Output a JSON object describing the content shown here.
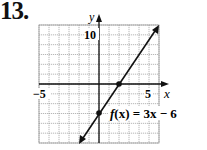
{
  "problem": {
    "number": "13."
  },
  "chart_data": {
    "type": "line",
    "title": "",
    "function_label": "f(x) = 3x − 6",
    "xlabel": "x",
    "ylabel": "y",
    "xlim": [
      -6,
      6
    ],
    "ylim": [
      -12,
      12
    ],
    "x_tick_labels": [
      {
        "value": -5,
        "label": "−5"
      },
      {
        "value": 5,
        "label": "5"
      }
    ],
    "y_tick_labels": [
      {
        "value": 10,
        "label": "10"
      }
    ],
    "grid": true,
    "grid_x_step": 1,
    "grid_y_step": 2,
    "series": [
      {
        "name": "f(x) = 3x − 6",
        "equation": "3x - 6",
        "x": [
          -2,
          6
        ],
        "y": [
          -12,
          12
        ],
        "arrows": "both"
      }
    ],
    "marked_points": [
      {
        "x": 2,
        "y": 0
      },
      {
        "x": 0,
        "y": -6
      }
    ],
    "legend": "none",
    "annotations": [
      {
        "text": "f(x) = 3x − 6",
        "x": 1,
        "y": -6
      }
    ]
  },
  "labels": {
    "y_axis": "y",
    "x_axis": "x",
    "x_neg5": "−5",
    "x_pos5": "5",
    "y_10": "10",
    "func_f": "f",
    "func_rest": "(x) = 3x − 6"
  }
}
